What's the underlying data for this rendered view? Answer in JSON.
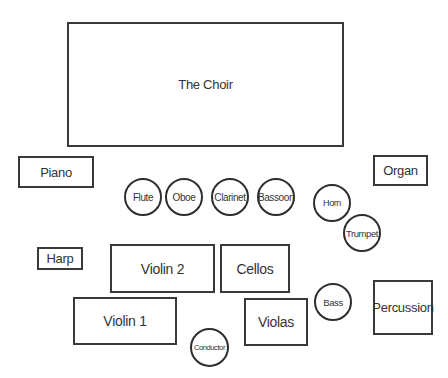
{
  "diagram": {
    "type": "orchestra-seating-chart",
    "sections": {
      "choir": "The Choir",
      "piano": "Piano",
      "organ": "Organ",
      "harp": "Harp",
      "violin2": "Violin 2",
      "cellos": "Cellos",
      "violin1": "Violin 1",
      "violas": "Violas",
      "percussion": "Percussion"
    },
    "players": {
      "flute": "Flute",
      "oboe": "Oboe",
      "clarinet": "Clarinet",
      "bassoon": "Bassoon",
      "horn": "Horn",
      "trumpet": "Trumpet",
      "bass": "Bass",
      "conductor": "Conductor"
    },
    "colors": {
      "stroke": "#3a3a3a",
      "text": "#333333",
      "background": "#ffffff"
    }
  }
}
